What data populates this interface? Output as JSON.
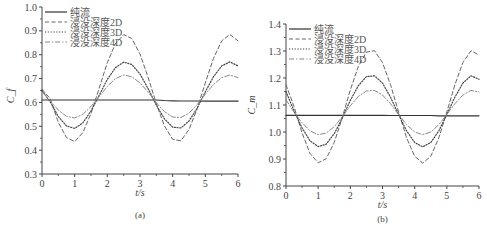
{
  "figure": {
    "captions": [
      "(a)",
      "(b)"
    ]
  },
  "chart_data": [
    {
      "type": "line",
      "caption": "(a)",
      "title": "",
      "xlabel": "t/s",
      "ylabel": "C_f",
      "xlim": [
        0,
        6
      ],
      "ylim": [
        0.3,
        1.0
      ],
      "xticks": [
        0,
        1,
        2,
        3,
        4,
        5,
        6
      ],
      "yticks": [
        0.3,
        0.4,
        0.5,
        0.6,
        0.7,
        0.8,
        0.9,
        1.0
      ],
      "ytick_labels": [
        "0.3",
        "0.4",
        "0.5",
        "0.6",
        "0.7",
        "0.8",
        "0.9",
        "1.0"
      ],
      "grid": false,
      "legend_position": "upper left",
      "x": [
        0,
        0.25,
        0.5,
        0.75,
        1.0,
        1.25,
        1.5,
        1.75,
        2.0,
        2.25,
        2.5,
        2.75,
        3.0,
        3.25,
        3.5,
        3.75,
        4.0,
        4.25,
        4.5,
        4.75,
        5.0,
        5.25,
        5.5,
        5.75,
        6.0
      ],
      "series": [
        {
          "name": "纯流",
          "style": "solid",
          "values": [
            0.61,
            0.61,
            0.61,
            0.61,
            0.61,
            0.61,
            0.61,
            0.61,
            0.61,
            0.61,
            0.61,
            0.61,
            0.61,
            0.61,
            0.61,
            0.608,
            0.607,
            0.606,
            0.606,
            0.606,
            0.605,
            0.605,
            0.605,
            0.605,
            0.605
          ]
        },
        {
          "name": "浸没深度2D",
          "style": "dashed",
          "values": [
            0.655,
            0.616,
            0.517,
            0.452,
            0.436,
            0.473,
            0.554,
            0.66,
            0.766,
            0.847,
            0.884,
            0.868,
            0.803,
            0.704,
            0.595,
            0.501,
            0.445,
            0.439,
            0.486,
            0.574,
            0.682,
            0.785,
            0.858,
            0.885,
            0.858
          ]
        },
        {
          "name": "浸没深度3D",
          "style": "dotted",
          "values": [
            0.65,
            0.603,
            0.541,
            0.501,
            0.491,
            0.514,
            0.564,
            0.63,
            0.696,
            0.746,
            0.769,
            0.759,
            0.719,
            0.657,
            0.589,
            0.531,
            0.496,
            0.493,
            0.522,
            0.576,
            0.644,
            0.708,
            0.753,
            0.77,
            0.753
          ]
        },
        {
          "name": "浸没深度4D",
          "style": "dashdot",
          "values": [
            0.645,
            0.607,
            0.568,
            0.542,
            0.535,
            0.55,
            0.583,
            0.625,
            0.667,
            0.7,
            0.715,
            0.708,
            0.682,
            0.643,
            0.599,
            0.561,
            0.539,
            0.537,
            0.555,
            0.591,
            0.634,
            0.675,
            0.704,
            0.715,
            0.704
          ]
        }
      ]
    },
    {
      "type": "line",
      "caption": "(b)",
      "title": "",
      "xlabel": "t/s",
      "ylabel": "C_m",
      "xlim": [
        0,
        6
      ],
      "ylim": [
        0.8,
        1.4
      ],
      "xticks": [
        0,
        1,
        2,
        3,
        4,
        5,
        6
      ],
      "yticks": [
        0.8,
        0.9,
        1.0,
        1.1,
        1.2,
        1.3,
        1.4
      ],
      "ytick_labels": [
        "0.8",
        "0.9",
        "1.0",
        "1.1",
        "1.2",
        "1.3",
        "1.4"
      ],
      "grid": false,
      "legend_position": "upper left",
      "x": [
        0,
        0.25,
        0.5,
        0.75,
        1.0,
        1.25,
        1.5,
        1.75,
        2.0,
        2.25,
        2.5,
        2.75,
        3.0,
        3.25,
        3.5,
        3.75,
        4.0,
        4.25,
        4.5,
        4.75,
        5.0,
        5.25,
        5.5,
        5.75,
        6.0
      ],
      "series": [
        {
          "name": "纯流",
          "style": "solid",
          "values": [
            1.062,
            1.062,
            1.062,
            1.062,
            1.062,
            1.062,
            1.062,
            1.062,
            1.062,
            1.062,
            1.062,
            1.062,
            1.062,
            1.061,
            1.061,
            1.061,
            1.061,
            1.061,
            1.061,
            1.06,
            1.06,
            1.06,
            1.06,
            1.06,
            1.06
          ]
        },
        {
          "name": "浸没深度2D",
          "style": "dashed",
          "values": [
            1.175,
            1.095,
            0.996,
            0.92,
            0.886,
            0.901,
            0.962,
            1.054,
            1.156,
            1.243,
            1.296,
            1.301,
            1.257,
            1.175,
            1.074,
            0.978,
            0.91,
            0.885,
            0.91,
            0.978,
            1.074,
            1.175,
            1.257,
            1.301,
            1.285
          ]
        },
        {
          "name": "浸没深度3D",
          "style": "dotted",
          "values": [
            1.15,
            1.078,
            1.015,
            0.967,
            0.946,
            0.955,
            0.994,
            1.052,
            1.117,
            1.172,
            1.205,
            1.208,
            1.181,
            1.129,
            1.065,
            1.004,
            0.961,
            0.945,
            0.961,
            1.004,
            1.065,
            1.129,
            1.181,
            1.208,
            1.195
          ]
        },
        {
          "name": "浸没深度4D",
          "style": "dashdot",
          "values": [
            1.12,
            1.073,
            1.034,
            1.004,
            0.99,
            0.996,
            1.02,
            1.057,
            1.097,
            1.132,
            1.152,
            1.154,
            1.137,
            1.105,
            1.065,
            1.027,
            1.0,
            0.99,
            1.0,
            1.027,
            1.065,
            1.105,
            1.137,
            1.154,
            1.148
          ]
        }
      ]
    }
  ]
}
